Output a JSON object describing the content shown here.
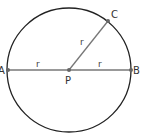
{
  "diagram": {
    "circle": {
      "cx": 69,
      "cy": 70,
      "r": 62,
      "stroke": "#222222"
    },
    "points": [
      {
        "name": "A",
        "x": 8,
        "y": 70
      },
      {
        "name": "B",
        "x": 131,
        "y": 70
      },
      {
        "name": "C",
        "x": 108,
        "y": 21
      },
      {
        "name": "P",
        "x": 69,
        "y": 70
      }
    ],
    "segments": [
      {
        "from": "A",
        "to": "P",
        "label": "r"
      },
      {
        "from": "P",
        "to": "B",
        "label": "r"
      },
      {
        "from": "P",
        "to": "C",
        "label": "r"
      }
    ],
    "labels": {
      "A": "A",
      "B": "B",
      "C": "C",
      "P": "P",
      "r_left": "r",
      "r_right": "r",
      "r_diag": "r"
    },
    "line_color": "#777777",
    "point_color": "#666666"
  }
}
